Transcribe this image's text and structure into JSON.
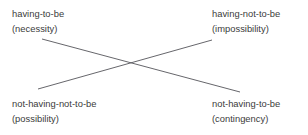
{
  "diagram": {
    "type": "modal-logic-square-of-opposition",
    "title": "",
    "background_color": "#ffffff",
    "text_color": "#3b3b3b",
    "line_color": "#55555a",
    "line_width": 0.9,
    "corners": [
      {
        "id": "top-left",
        "position": "top-left",
        "term": "having-to-be",
        "modal": "(necessity)",
        "x": 12,
        "y": 6
      },
      {
        "id": "top-right",
        "position": "top-right",
        "term": "having-not-to-be",
        "modal": "(impossibility)",
        "x": 212,
        "y": 6
      },
      {
        "id": "bottom-left",
        "position": "bottom-left",
        "term": "not-having-not-to-be",
        "modal": "(possibility)",
        "x": 12,
        "y": 96
      },
      {
        "id": "bottom-right",
        "position": "bottom-right",
        "term": "not-having-to-be",
        "modal": "(contingency)",
        "x": 212,
        "y": 96
      }
    ],
    "connectors": [
      {
        "id": "contradictory-necessity-contingency",
        "relation": "contradictory",
        "from": "top-left",
        "to": "bottom-right",
        "x1": 42,
        "y1": 39,
        "x2": 240,
        "y2": 92
      },
      {
        "id": "contradictory-possibility-impossibility",
        "relation": "contradictory",
        "from": "bottom-left",
        "to": "top-right",
        "x1": 38,
        "y1": 89,
        "x2": 212,
        "y2": 40
      }
    ]
  }
}
